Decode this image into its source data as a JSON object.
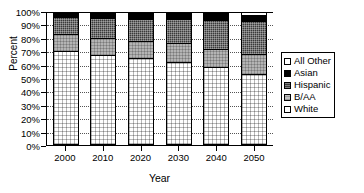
{
  "chart_data": {
    "type": "bar",
    "title": "",
    "xlabel": "Year",
    "ylabel": "Percent",
    "categories": [
      "2000",
      "2010",
      "2020",
      "2030",
      "2040",
      "2050"
    ],
    "ylim": [
      0,
      100
    ],
    "grid": true,
    "stacked": true,
    "legend_position": "right",
    "ytick_labels": [
      "100%",
      "90%",
      "80%",
      "70%",
      "60%",
      "50%",
      "40%",
      "30%",
      "20%",
      "10%",
      "0%"
    ],
    "ytick_values": [
      100,
      90,
      80,
      70,
      60,
      50,
      40,
      30,
      20,
      10,
      0
    ],
    "series": [
      {
        "name": "White",
        "values": [
          71,
          68,
          65,
          62,
          58,
          53
        ]
      },
      {
        "name": "B/AA",
        "values": [
          13,
          13,
          13,
          14,
          14,
          15
        ]
      },
      {
        "name": "Hispanic",
        "values": [
          13,
          15,
          17,
          19,
          22,
          25
        ]
      },
      {
        "name": "Asian",
        "values": [
          3,
          4,
          4,
          4,
          5,
          5
        ]
      },
      {
        "name": "All Other",
        "values": [
          0,
          0,
          1,
          1,
          1,
          2
        ]
      }
    ]
  },
  "legend": {
    "items": [
      {
        "label": "All Other",
        "swatch": "other"
      },
      {
        "label": "Asian",
        "swatch": "asian"
      },
      {
        "label": "Hispanic",
        "swatch": "hispanic"
      },
      {
        "label": "B/AA",
        "swatch": "baa"
      },
      {
        "label": "White",
        "swatch": "white"
      }
    ]
  }
}
